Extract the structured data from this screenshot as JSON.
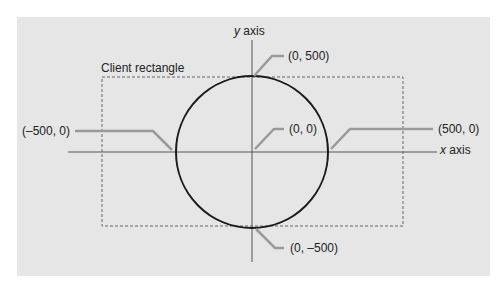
{
  "diagram": {
    "background_color": "#e6e6e6",
    "page_color": "#ffffff",
    "axis_color": "#555555",
    "circle_color": "#1a1a1a",
    "leader_color": "#9a9a9a",
    "dashed_rect_color": "#666666",
    "labels": {
      "y_axis_var": "y",
      "y_axis_word": " axis",
      "x_axis_var": "x",
      "x_axis_word": " axis",
      "client_rectangle": "Client rectangle",
      "top_point": "(0, 500)",
      "origin_point": "(0, 0)",
      "left_point": "(–500, 0)",
      "right_point": "(500, 0)",
      "bottom_point": "(0, –500)"
    },
    "geometry": {
      "center": [
        252,
        152
      ],
      "radius": 76,
      "client_rect": {
        "x": 102,
        "y": 77,
        "width": 301,
        "height": 149
      },
      "x_axis": {
        "x1": 68,
        "x2": 437,
        "y": 152
      },
      "y_axis": {
        "x": 252,
        "y1": 40,
        "y2": 262
      }
    }
  }
}
